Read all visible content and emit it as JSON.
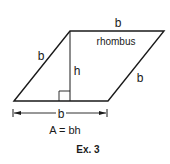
{
  "diagram": {
    "shape_label": "rhombus",
    "side_labels": {
      "top": "b",
      "left": "b",
      "right": "b",
      "base_dimension": "b"
    },
    "height_label": "h",
    "formula": "A = bh",
    "caption": "Ex. 3",
    "colors": {
      "stroke": "#1a1a1a",
      "background": "#ffffff"
    }
  }
}
